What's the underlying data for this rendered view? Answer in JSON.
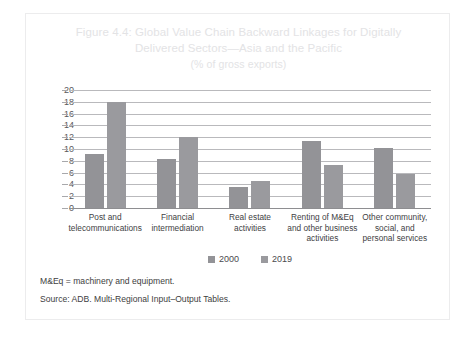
{
  "figure": {
    "title_line1": "Figure 4.4: Global Value Chain Backward Linkages for Digitally",
    "title_line2": "Delivered Sectors—Asia and the Pacific",
    "title_line3": "(% of gross exports)",
    "notes": [
      "M&Eq = machinery and equipment.",
      "Source: ADB. Multi-Regional Input–Output Tables."
    ],
    "colors": {
      "series_2000": "#939397",
      "series_2019": "#9a9a9e",
      "gridline": "#b9b9bc",
      "axis_text": "#58585b",
      "title_text": "#e3e3e5",
      "border": "#ececed"
    }
  },
  "chart_data": {
    "type": "bar",
    "title": "Figure 4.4: Global Value Chain Backward Linkages for Digitally Delivered Sectors—Asia and the Pacific (% of gross exports)",
    "xlabel": "",
    "ylabel": "",
    "ylim": [
      0,
      20
    ],
    "yticks": [
      0,
      2,
      4,
      6,
      8,
      10,
      12,
      14,
      16,
      18,
      20
    ],
    "ytick_labels": [
      "0",
      "2",
      "4",
      "6",
      "8",
      "10",
      "12",
      "14",
      "16",
      "18",
      "20"
    ],
    "grid": true,
    "legend_position": "bottom",
    "categories": [
      "Post and\ntelecommunications",
      "Financial\nintermediation",
      "Real estate\nactivities",
      "Renting of M&Eq\nand other business\nactivities",
      "Other community,\nsocial, and\npersonal services"
    ],
    "category_lines": [
      [
        "Post and",
        "telecommunications"
      ],
      [
        "Financial",
        "intermediation"
      ],
      [
        "Real estate",
        "activities"
      ],
      [
        "Renting of M&Eq",
        "and other business",
        "activities"
      ],
      [
        "Other community,",
        "social, and",
        "personal services"
      ]
    ],
    "series": [
      {
        "name": "2000",
        "values": [
          9.2,
          8.3,
          3.5,
          11.3,
          10.2
        ],
        "color": "#939397"
      },
      {
        "name": "2019",
        "values": [
          18.0,
          12.0,
          4.6,
          7.3,
          5.8
        ],
        "color": "#9a9a9e"
      }
    ]
  }
}
